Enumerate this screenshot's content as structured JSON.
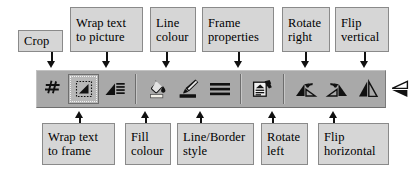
{
  "figure": {
    "type": "annotated-toolbar-diagram",
    "toolbar_background": "#a9a9a9",
    "label_background": "#d6d6d6",
    "label_border": "#8a8a8a"
  },
  "toolbar": {
    "name": "picture-frame-toolbar",
    "groups": [
      {
        "name": "group-crop-wrap",
        "tools": [
          {
            "id": "crop",
            "icon": "crop-icon",
            "label": "Crop",
            "pressed": false
          },
          {
            "id": "wrap-to-frame",
            "icon": "wrap-text-frame-icon",
            "label": "Wrap text to frame",
            "pressed": true
          },
          {
            "id": "wrap-to-picture",
            "icon": "wrap-text-picture-icon",
            "label": "Wrap text to picture",
            "pressed": false
          }
        ]
      },
      {
        "name": "group-colour-style",
        "tools": [
          {
            "id": "fill-colour",
            "icon": "paint-bucket-icon",
            "label": "Fill colour",
            "pressed": false
          },
          {
            "id": "line-colour",
            "icon": "paint-brush-icon",
            "label": "Line colour",
            "pressed": false
          },
          {
            "id": "line-border-style",
            "icon": "line-style-icon",
            "label": "Line/Border style",
            "pressed": false
          }
        ]
      },
      {
        "name": "group-frame",
        "tools": [
          {
            "id": "frame-properties",
            "icon": "frame-properties-icon",
            "label": "Frame properties",
            "pressed": false
          }
        ]
      },
      {
        "name": "group-transform",
        "tools": [
          {
            "id": "rotate-left",
            "icon": "rotate-left-icon",
            "label": "Rotate left",
            "pressed": false
          },
          {
            "id": "rotate-right",
            "icon": "rotate-right-icon",
            "label": "Rotate right",
            "pressed": false
          },
          {
            "id": "flip-horizontal",
            "icon": "flip-horizontal-icon",
            "label": "Flip horizontal",
            "pressed": false
          },
          {
            "id": "flip-vertical",
            "icon": "flip-vertical-icon",
            "label": "Flip vertical",
            "pressed": false
          }
        ]
      }
    ]
  },
  "callouts": {
    "above": [
      {
        "id": "crop",
        "text": "Crop"
      },
      {
        "id": "wrap-to-picture",
        "text": "Wrap text\nto picture"
      },
      {
        "id": "line-colour",
        "text": "Line\ncolour"
      },
      {
        "id": "frame-properties",
        "text": "Frame\nproperties"
      },
      {
        "id": "rotate-right",
        "text": "Rotate\nright"
      },
      {
        "id": "flip-vertical",
        "text": "Flip\nvertical"
      }
    ],
    "below": [
      {
        "id": "wrap-to-frame",
        "text": "Wrap text\nto frame"
      },
      {
        "id": "fill-colour",
        "text": "Fill\ncolour"
      },
      {
        "id": "line-border-style",
        "text": "Line/Border\nstyle"
      },
      {
        "id": "rotate-left",
        "text": "Rotate\nleft"
      },
      {
        "id": "flip-horizontal",
        "text": "Flip\nhorizontal"
      }
    ]
  }
}
